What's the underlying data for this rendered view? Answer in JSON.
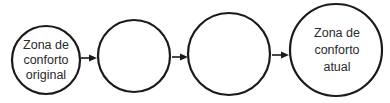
{
  "diagram": {
    "type": "flow",
    "direction": "left-to-right",
    "stroke_color": "#1a1a1a",
    "text_color": "#2a2a2a",
    "background": "#ffffff",
    "nodes": [
      {
        "id": "c1",
        "lines": [
          "Zona de",
          "conforto",
          "original"
        ],
        "cx": 46,
        "cy": 60,
        "r": 34
      },
      {
        "id": "c2",
        "lines": [],
        "cx": 134,
        "cy": 56,
        "r": 36
      },
      {
        "id": "c3",
        "lines": [],
        "cx": 229,
        "cy": 54,
        "r": 41
      },
      {
        "id": "c4",
        "lines": [
          "Zona de",
          "conforto",
          "atual"
        ],
        "cx": 336,
        "cy": 50,
        "r": 46
      }
    ],
    "edges": [
      {
        "from": "c1",
        "to": "c2",
        "x1": 81,
        "x2": 97,
        "y": 58
      },
      {
        "from": "c2",
        "to": "c3",
        "x1": 172,
        "x2": 188,
        "y": 57
      },
      {
        "from": "c3",
        "to": "c4",
        "x1": 272,
        "x2": 289,
        "y": 55
      }
    ]
  }
}
